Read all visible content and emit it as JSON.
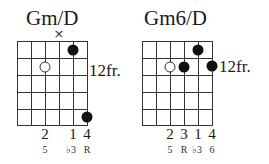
{
  "chords": [
    {
      "name": "Gm/D",
      "fret_label": "12fr.",
      "strings": 6,
      "frets_shown": 5,
      "muted": [
        {
          "string": 4,
          "symbol": "×"
        }
      ],
      "dots": [
        {
          "string": 5,
          "fret": 1,
          "type": "filled"
        },
        {
          "string": 3,
          "fret": 2,
          "type": "open"
        },
        {
          "string": 6,
          "fret": 5,
          "type": "filled"
        }
      ],
      "fingers": [
        {
          "string": 3,
          "label": "2"
        },
        {
          "string": 5,
          "label": "1"
        },
        {
          "string": 6,
          "label": "4"
        }
      ],
      "intervals": [
        {
          "string": 3,
          "label": "5"
        },
        {
          "string": 5,
          "label": "♭3"
        },
        {
          "string": 6,
          "label": "R"
        }
      ]
    },
    {
      "name": "Gm6/D",
      "fret_label": "12fr.",
      "strings": 6,
      "frets_shown": 5,
      "muted": [],
      "dots": [
        {
          "string": 5,
          "fret": 1,
          "type": "filled"
        },
        {
          "string": 3,
          "fret": 2,
          "type": "open"
        },
        {
          "string": 4,
          "fret": 2,
          "type": "filled"
        },
        {
          "string": 6,
          "fret": 2,
          "type": "filled"
        }
      ],
      "fingers": [
        {
          "string": 3,
          "label": "2"
        },
        {
          "string": 4,
          "label": "3"
        },
        {
          "string": 5,
          "label": "1"
        },
        {
          "string": 6,
          "label": "4"
        }
      ],
      "intervals": [
        {
          "string": 3,
          "label": "5"
        },
        {
          "string": 4,
          "label": "R"
        },
        {
          "string": 5,
          "label": "♭3"
        },
        {
          "string": 6,
          "label": "6"
        }
      ]
    }
  ]
}
